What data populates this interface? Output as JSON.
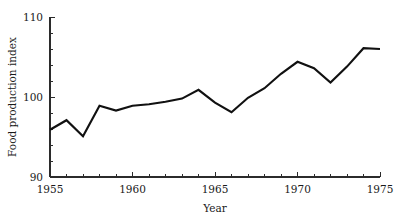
{
  "chart_data": {
    "type": "line",
    "title": "",
    "xlabel": "Year",
    "ylabel": "Food production index",
    "xlim": [
      1955,
      1975
    ],
    "ylim": [
      90,
      110
    ],
    "grid": false,
    "legend": null,
    "x_tick_labels": [
      "1955",
      "1960",
      "1965",
      "1970",
      "1975"
    ],
    "x_tick_values": [
      1955,
      1960,
      1965,
      1970,
      1975
    ],
    "x_minor_tick_values": [
      1956,
      1957,
      1958,
      1959,
      1961,
      1962,
      1963,
      1964,
      1966,
      1967,
      1968,
      1969,
      1971,
      1972,
      1973,
      1974
    ],
    "y_tick_labels": [
      "90",
      "100",
      "110"
    ],
    "y_tick_values": [
      90,
      100,
      110
    ],
    "y_minor_tick_values": [
      92,
      94,
      96,
      98,
      102,
      104,
      106,
      108
    ],
    "series": [
      {
        "name": "Food production index",
        "x": [
          1955,
          1956,
          1957,
          1958,
          1959,
          1960,
          1961,
          1962,
          1963,
          1964,
          1965,
          1966,
          1967,
          1968,
          1969,
          1970,
          1971,
          1972,
          1973,
          1974,
          1975
        ],
        "values": [
          95.9,
          97.1,
          95.1,
          98.9,
          98.3,
          98.9,
          99.1,
          99.4,
          99.8,
          100.9,
          99.3,
          98.1,
          99.9,
          101.1,
          102.9,
          104.4,
          103.6,
          101.8,
          103.8,
          106.1,
          106.0
        ]
      }
    ],
    "line_color": "#111111",
    "axis_color": "#2b2b2b",
    "background_color": "#ffffff"
  },
  "geometry": {
    "plot_left": 50,
    "plot_right": 380,
    "plot_top": 17,
    "plot_bottom": 177
  }
}
